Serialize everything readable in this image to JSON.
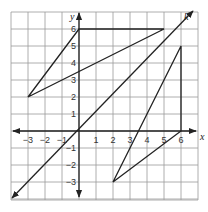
{
  "diagram": {
    "axes": {
      "x_label": "x",
      "y_label": "y",
      "line_label": "k"
    },
    "x_ticks": [
      {
        "v": -3,
        "label": "−3"
      },
      {
        "v": -2,
        "label": "−2"
      },
      {
        "v": -1,
        "label": "−1"
      },
      {
        "v": 1,
        "label": "1"
      },
      {
        "v": 2,
        "label": "2"
      },
      {
        "v": 3,
        "label": "3"
      },
      {
        "v": 4,
        "label": "4"
      },
      {
        "v": 5,
        "label": "5"
      },
      {
        "v": 6,
        "label": "6"
      }
    ],
    "y_ticks": [
      {
        "v": 6,
        "label": "6"
      },
      {
        "v": 5,
        "label": "5"
      },
      {
        "v": 4,
        "label": "4"
      },
      {
        "v": 3,
        "label": "3"
      },
      {
        "v": 2,
        "label": "2"
      },
      {
        "v": 1,
        "label": "1"
      },
      {
        "v": -1,
        "label": "−1"
      },
      {
        "v": -2,
        "label": "−2"
      },
      {
        "v": -3,
        "label": "−3"
      }
    ],
    "triangle_1": [
      [
        -3,
        2
      ],
      [
        0,
        6
      ],
      [
        5,
        6
      ]
    ],
    "triangle_2": [
      [
        2,
        -3
      ],
      [
        6,
        5
      ],
      [
        6,
        0
      ]
    ],
    "line_k": {
      "from": [
        -4.5,
        -4.5
      ],
      "to": [
        7.5,
        7.8
      ],
      "equation": "y = x"
    },
    "colors": {
      "grid": "#9a9a9a",
      "ink": "#222222"
    }
  }
}
